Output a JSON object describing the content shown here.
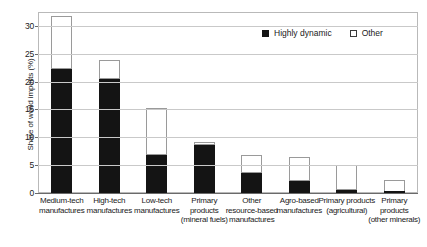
{
  "top_caption": "",
  "legend": {
    "position": "top-right",
    "items": [
      {
        "label": "Highly dynamic",
        "swatch": "filled-square-icon",
        "color": "#141414"
      },
      {
        "label": "Other",
        "swatch": "hollow-square-icon",
        "color": "#ffffff"
      }
    ]
  },
  "axes": {
    "ylabel": "Share of world imports (%)",
    "xlabel": "",
    "yticks": [
      0,
      5,
      10,
      15,
      20,
      25,
      30
    ],
    "ytick_labels": [
      "0",
      "5",
      "10",
      "15",
      "20",
      "25",
      "30"
    ],
    "ylim": [
      0,
      32.5
    ],
    "grid": "horizontal"
  },
  "chart_data": {
    "type": "bar",
    "subtype": "stacked-vertical",
    "title": "",
    "xlabel": "",
    "ylabel": "Share of world imports (%)",
    "ylim": [
      0,
      32.5
    ],
    "yticks": [
      0,
      5,
      10,
      15,
      20,
      25,
      30
    ],
    "grid": true,
    "legend_position": "top-right",
    "categories": [
      "Medium-tech manufactures",
      "High-tech manufactures",
      "Low-tech manufactures",
      "Primary products (mineral fuels)",
      "Other resource-based manufactures",
      "Agro-based manufactures",
      "Primary products (agricultural)",
      "Primary products (other minerals)"
    ],
    "category_lines": [
      [
        "Medium-tech",
        "manufactures"
      ],
      [
        "High-tech",
        "manufactures"
      ],
      [
        "Low-tech",
        "manufactures"
      ],
      [
        "Primary",
        "products",
        "(mineral fuels)"
      ],
      [
        "Other",
        "resource-based",
        "manufactures"
      ],
      [
        "Agro-based",
        "manufactures"
      ],
      [
        "Primary products",
        "(agricultural)"
      ],
      [
        "Primary",
        "products",
        "(other minerals)"
      ]
    ],
    "series": [
      {
        "name": "Highly dynamic",
        "color": "#141414",
        "values": [
          22.2,
          20.4,
          6.9,
          8.6,
          3.6,
          2.2,
          0.5,
          0.1
        ]
      },
      {
        "name": "Other",
        "color": "#ffffff",
        "values": [
          9.5,
          3.5,
          8.4,
          0.5,
          3.3,
          4.2,
          4.5,
          2.3
        ]
      }
    ],
    "totals": [
      31.7,
      23.9,
      15.3,
      9.1,
      6.9,
      6.4,
      5.0,
      2.4
    ]
  }
}
